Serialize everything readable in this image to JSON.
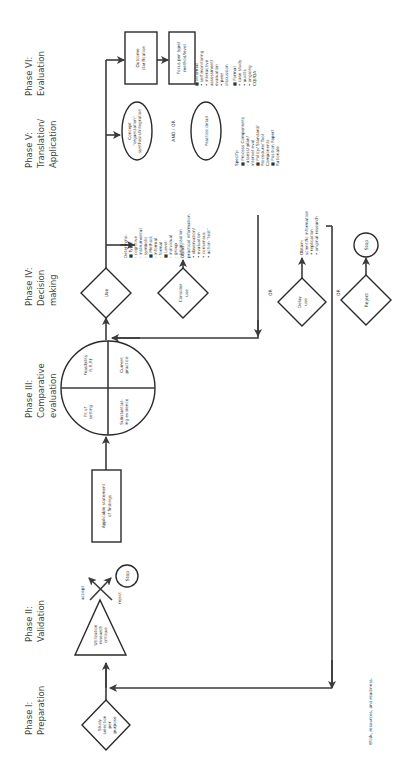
{
  "phases": [
    {
      "id": "I",
      "line1": "Phase I:",
      "line2": "Preparation",
      "line3": ""
    },
    {
      "id": "II",
      "line1": "Phase II:",
      "line2": "Validation",
      "line3": ""
    },
    {
      "id": "III",
      "line1": "Phase III:",
      "line2": "Comparative",
      "line3": "evaluation"
    },
    {
      "id": "IV",
      "line1": "Phase IV:",
      "line2": "Decision",
      "line3": "making"
    },
    {
      "id": "V",
      "line1": "Phase V:",
      "line2": "Translation/",
      "line3": "Application"
    },
    {
      "id": "VI",
      "line1": "Phase VI:",
      "line2": "Evaluation",
      "line3": ""
    }
  ],
  "phase1": {
    "diamond": [
      "Study",
      "selection",
      "per",
      "purpose"
    ]
  },
  "phase2": {
    "triangle": [
      "Utilization",
      "research",
      "critique"
    ],
    "accept_label": "accept",
    "reject_label": "reject",
    "stop_label": "Stop",
    "findings_box": [
      "Applicable statement",
      "of findings"
    ]
  },
  "phase3": {
    "quadrants": {
      "top_left": [
        "Fit of",
        "setting"
      ],
      "top_right": [
        "Feasibility",
        "R,R,R†"
      ],
      "bottom_left": [
        "Substantiat-",
        "ing evidence"
      ],
      "bottom_right": [
        "Current",
        "practice"
      ]
    }
  },
  "phase4": {
    "use": "Use",
    "consider_use": [
      "Consider",
      "use"
    ],
    "delay_use": [
      "Delay",
      "use"
    ],
    "reject": "Reject",
    "or_label": "OR",
    "stop_label": "Stop",
    "use_details": [
      "Determine:",
      "■ Type:",
      "  - cognitive",
      "  - instrumental",
      "  - symbolic",
      "■ Method:",
      "  - informal",
      "  - formal",
      "■ Level:",
      "  - individual",
      "  - group",
      "  - organization"
    ],
    "consider_details": [
      "Obtain:",
      "practical information",
      "• observation/",
      "• evaluation",
      "• consensus",
      "• action \"test\""
    ],
    "delay_details": [
      "Obtain:",
      "scientific information",
      "• replication",
      "• original research"
    ]
  },
  "phase5": {
    "concept_ellipse": [
      "Concept",
      "\"organization\"",
      "synthesis/integration"
    ],
    "and_or": "AND / OR",
    "practice_ellipse": "Practice detail",
    "specify": [
      "Specify:",
      "■ Process Components",
      "  - assess/ plan/",
      "    interve/ eval",
      "■ Policy/ Standard/",
      "  Procedure/ Tool",
      "  Components",
      "■ Position Paper/",
      "  Rationale"
    ]
  },
  "phase6": {
    "outcome_box": [
      "Outcome",
      "clarification"
    ],
    "focus_box": [
      "Focus per type/",
      "method/level"
    ],
    "eval_details": [
      "■ Informal",
      "  • self monitoring",
      "  • interactive",
      "    assessment/",
      "    evaluation",
      "  • peer",
      "    discussion",
      "■ Formal",
      "  • case study",
      "  • audits",
      "  • ongoing",
      "    CQI/QA"
    ]
  },
  "footnote": "†Risk, resources, and readiness."
}
